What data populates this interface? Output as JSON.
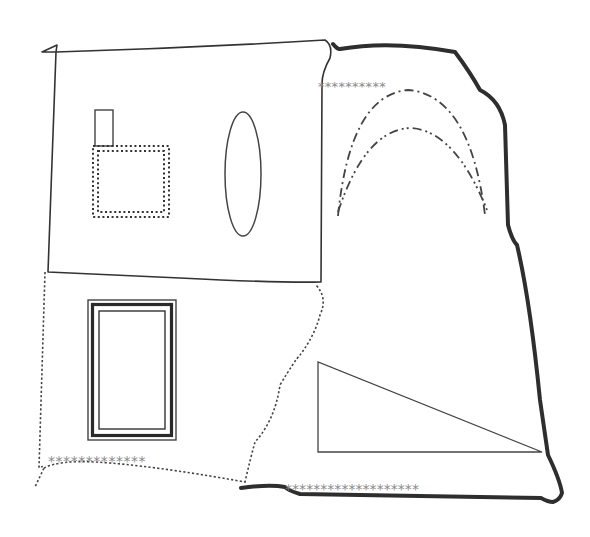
{
  "diagram": {
    "title": "",
    "canvas": {
      "width": 590,
      "height": 537,
      "background": "#ffffff"
    },
    "colors": {
      "line": "#333333",
      "thick": "#2e2e2e",
      "stars": "#8a8a8a"
    },
    "regions": [
      {
        "id": "top-left-region",
        "border": "thin-solid",
        "path": "M 42 52 L 57 45 L 56 52 Q 190 48 325 40 Q 333 45 330 58 Q 322 72 322 84 L 321 282 Q 280 283 180 278 L 48 272 L 56 52 Z"
      },
      {
        "id": "right-region",
        "border": "thick-solid",
        "path": "M 333 44 Q 338 50 340 49 Q 390 40 455 52 Q 470 72 480 90 Q 500 100 505 125 L 508 225 Q 512 240 517 245 Q 530 300 540 400 L 548 455 Q 560 480 562 493 Q 560 500 553 502 Q 548 502 541 498 L 300 494 Q 287 490 285 487 Q 270 484 241 488"
      },
      {
        "id": "bottom-left-region",
        "border": "dotted",
        "path": "M 45 272 L 39 468 Q 44 465 44 468 L 35 487 M 44 468 Q 60 460 95 462 Q 150 465 245 482 Q 250 460 255 442 Q 275 420 280 385 Q 295 360 300 355 Q 315 335 320 315 Q 328 298 316 285"
      }
    ],
    "shapes": [
      {
        "id": "small-rectangle",
        "type": "rect",
        "x": 95,
        "y": 110,
        "width": 18,
        "height": 36,
        "style": "solid"
      },
      {
        "id": "dotted-square",
        "type": "rect",
        "x": 93,
        "y": 146,
        "width": 76,
        "height": 71,
        "style": "double-dotted"
      },
      {
        "id": "tall-ellipse",
        "type": "ellipse",
        "cx": 243,
        "cy": 174,
        "rx": 18,
        "ry": 62,
        "style": "solid"
      },
      {
        "id": "outer-arc",
        "type": "arc",
        "path": "M 338 216 Q 350 95 408 90 Q 470 95 485 215",
        "style": "dash-dot"
      },
      {
        "id": "inner-arc",
        "type": "arc",
        "path": "M 338 212 Q 365 130 410 128 Q 455 130 487 210",
        "style": "dash-dot-dot"
      },
      {
        "id": "triple-frame",
        "type": "rect",
        "x": 88,
        "y": 300,
        "width": 88,
        "height": 140,
        "style": "triple"
      },
      {
        "id": "right-triangle",
        "type": "polygon",
        "points": "318,362 318,452 542,452",
        "style": "solid"
      }
    ],
    "star_rows": [
      {
        "id": "stars-top",
        "count": 10,
        "text": "**********"
      },
      {
        "id": "stars-left",
        "count": 13,
        "text": "*************"
      },
      {
        "id": "stars-bottom",
        "count": 19,
        "text": "*******************"
      }
    ]
  }
}
